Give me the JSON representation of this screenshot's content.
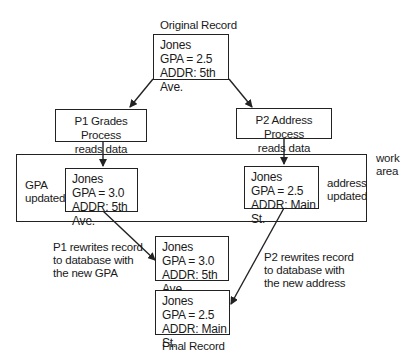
{
  "diagram": {
    "original_record": {
      "caption": "Original Record",
      "lines": [
        "Jones",
        "GPA = 2.5",
        "ADDR: 5th Ave."
      ]
    },
    "p1_process": {
      "line1": "P1  Grades Process",
      "line2": "reads data"
    },
    "p2_process": {
      "line1": "P2  Address Process",
      "line2": "reads data"
    },
    "work_area": {
      "label_line1": "work",
      "label_line2": "area",
      "left_note": [
        "GPA",
        "updated"
      ],
      "right_note": [
        "address",
        "updated"
      ],
      "p1_record": [
        "Jones",
        "GPA = 3.0",
        "ADDR: 5th Ave."
      ],
      "p2_record": [
        "Jones",
        "GPA = 2.5",
        "ADDR: Main St."
      ]
    },
    "p1_rewrite": {
      "note": [
        "P1 rewrites record",
        "to database with",
        "the new GPA"
      ],
      "record": [
        "Jones",
        "GPA = 3.0",
        "ADDR: 5th Ave."
      ]
    },
    "p2_rewrite": {
      "note": [
        "P2 rewrites record",
        "to database with",
        "the new address"
      ]
    },
    "final_record": {
      "caption": "Final Record",
      "lines": [
        "Jones",
        "GPA = 2.5",
        "ADDR: Main St."
      ]
    },
    "colors": {
      "stroke": "#222222",
      "text": "#1a1a1a",
      "background": "#ffffff"
    }
  }
}
